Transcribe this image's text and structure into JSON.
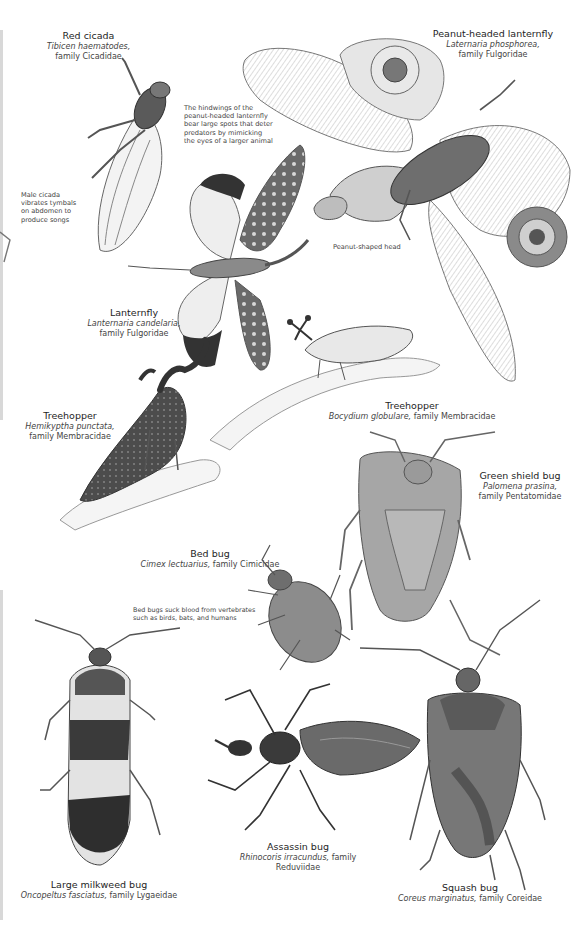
{
  "page": {
    "background": "#ffffff",
    "specimens": [
      {
        "id": "red-cicada",
        "common": "Red cicada",
        "sci_name": "Tibicen haematodes,",
        "family": "family Cicadidae"
      },
      {
        "id": "peanut-headed-lanternfly",
        "common": "Peanut-headed lanternfly",
        "sci_name": "Laternaria phosphorea,",
        "family": "family Fulgoridae"
      },
      {
        "id": "lanternfly",
        "common": "Lanternfly",
        "sci_name": "Lanternaria candelaria,",
        "family": "family Fulgoridae"
      },
      {
        "id": "treehopper-hemikyptha",
        "common": "Treehopper",
        "sci_name": "Hemikyptha punctata,",
        "family": "family Membracidae"
      },
      {
        "id": "treehopper-bocydium",
        "common": "Treehopper",
        "sci_name": "Bocydium globulare,",
        "family": "family Membracidae"
      },
      {
        "id": "green-shield-bug",
        "common": "Green shield bug",
        "sci_name": "Palomena prasina,",
        "family": "family Pentatomidae"
      },
      {
        "id": "bed-bug",
        "common": "Bed bug",
        "sci_name": "Cimex lectuarius,",
        "family": "family Cimicidae"
      },
      {
        "id": "assassin-bug",
        "common": "Assassin bug",
        "sci_name": "Rhinocoris irracundus,",
        "family": "family Reduviidae"
      },
      {
        "id": "large-milkweed-bug",
        "common": "Large milkweed bug",
        "sci_name": "Oncopeltus fasciatus,",
        "family": "family Lygaeidae"
      },
      {
        "id": "squash-bug",
        "common": "Squash bug",
        "sci_name": "Coreus marginatus,",
        "family": "family Coreidae"
      }
    ],
    "notes": {
      "hindwings": [
        "The hindwings of the",
        "peanut-headed lanternfly",
        "bear large spots that deter",
        "predators by mimicking",
        "the eyes of a larger animal"
      ],
      "cicada": [
        "Male cicada",
        "vibrates tymbals",
        "on abdomen to",
        "produce songs"
      ],
      "peanut_head": "Peanut-shaped head",
      "bedbug": [
        "Bed bugs suck blood from vertebrates",
        "such as birds, bats, and humans"
      ]
    }
  }
}
